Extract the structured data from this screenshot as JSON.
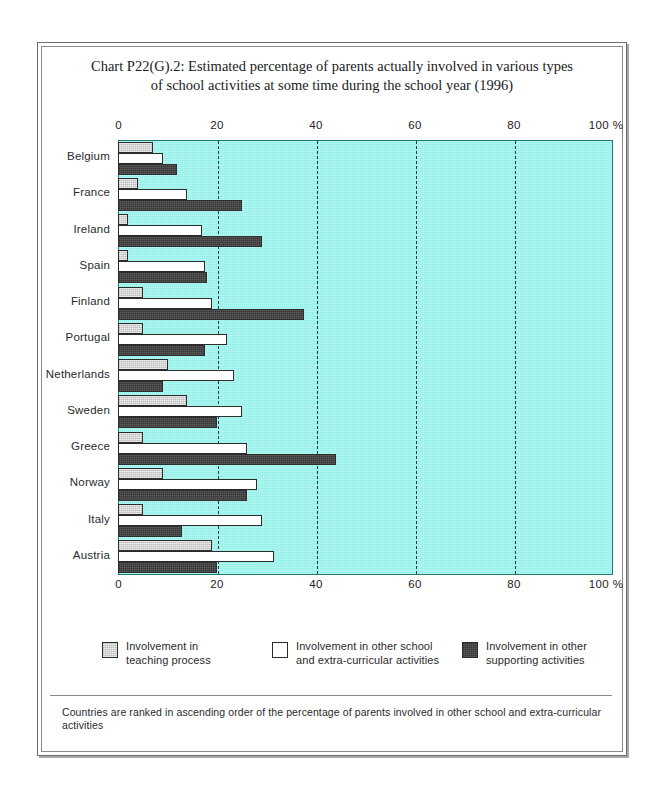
{
  "chart_data": {
    "type": "bar",
    "orientation": "horizontal",
    "grouped": true,
    "title": "Chart P22(G).2: Estimated percentage of parents actually involved in various types of school activities at some time during the school year (1996)",
    "title_line1": "Chart P22(G).2: Estimated percentage of parents actually involved in various types",
    "title_line2": "of school activities at some time during the school year (1996)",
    "xlabel": "",
    "ylabel": "",
    "xlim": [
      0,
      100
    ],
    "x_unit": "%",
    "grid": true,
    "grid_style": "dashed vertical",
    "legend_position": "bottom",
    "axis_top_and_bottom": true,
    "tick_values": [
      0,
      20,
      40,
      60,
      80,
      100
    ],
    "tick_labels": [
      "0",
      "20",
      "40",
      "60",
      "80",
      "100 %"
    ],
    "categories": [
      "Belgium",
      "France",
      "Ireland",
      "Spain",
      "Finland",
      "Portugal",
      "Netherlands",
      "Sweden",
      "Greece",
      "Norway",
      "Italy",
      "Austria"
    ],
    "series": [
      {
        "name": "Involvement in teaching process",
        "legend_line1": "Involvement in",
        "legend_line2": "teaching process",
        "color": "#d3d3d3",
        "values": [
          7,
          4,
          2,
          2,
          5,
          5,
          10,
          14,
          5,
          9,
          5,
          19
        ]
      },
      {
        "name": "Involvement in other school and extra-curricular activities",
        "legend_line1": "Involvement in other school",
        "legend_line2": "and extra-curricular activities",
        "color": "#ffffff",
        "values": [
          9,
          14,
          17,
          17.5,
          19,
          22,
          23.5,
          25,
          26,
          28,
          29,
          31.5
        ]
      },
      {
        "name": "Involvement in other supporting activities",
        "legend_line1": "Involvement in other",
        "legend_line2": "supporting activities",
        "color": "#474747",
        "values": [
          12,
          25,
          29,
          18,
          37.5,
          17.5,
          9,
          20,
          44,
          26,
          13,
          20
        ]
      }
    ],
    "plot_background": "#8ef0e8",
    "footnote": "Countries are ranked in ascending order of the percentage of parents involved in other school and extra-curricular activities"
  }
}
